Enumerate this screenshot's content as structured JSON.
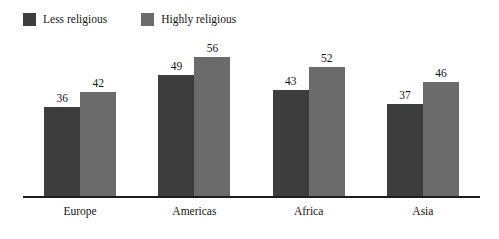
{
  "chart_data": {
    "type": "bar",
    "title": "",
    "subtitle": "",
    "xlabel": "",
    "ylabel": "",
    "categories": [
      "Europe",
      "Americas",
      "Africa",
      "Asia"
    ],
    "series": [
      {
        "name": "Less religious",
        "color": "#3d3d3d",
        "values": [
          36,
          49,
          43,
          37
        ]
      },
      {
        "name": "Highly religious",
        "color": "#6b6b6b",
        "values": [
          42,
          56,
          52,
          46
        ]
      }
    ],
    "ylim": [
      0,
      63
    ],
    "grid": false,
    "legend_position": "top-left",
    "value_labels": true,
    "axis_line_color": "#1d1d1d",
    "background_color": "#ffffff"
  },
  "legend": {
    "entries": [
      {
        "label": "Less religious",
        "color": "#3d3d3d"
      },
      {
        "label": "Highly religious",
        "color": "#6b6b6b"
      }
    ]
  }
}
